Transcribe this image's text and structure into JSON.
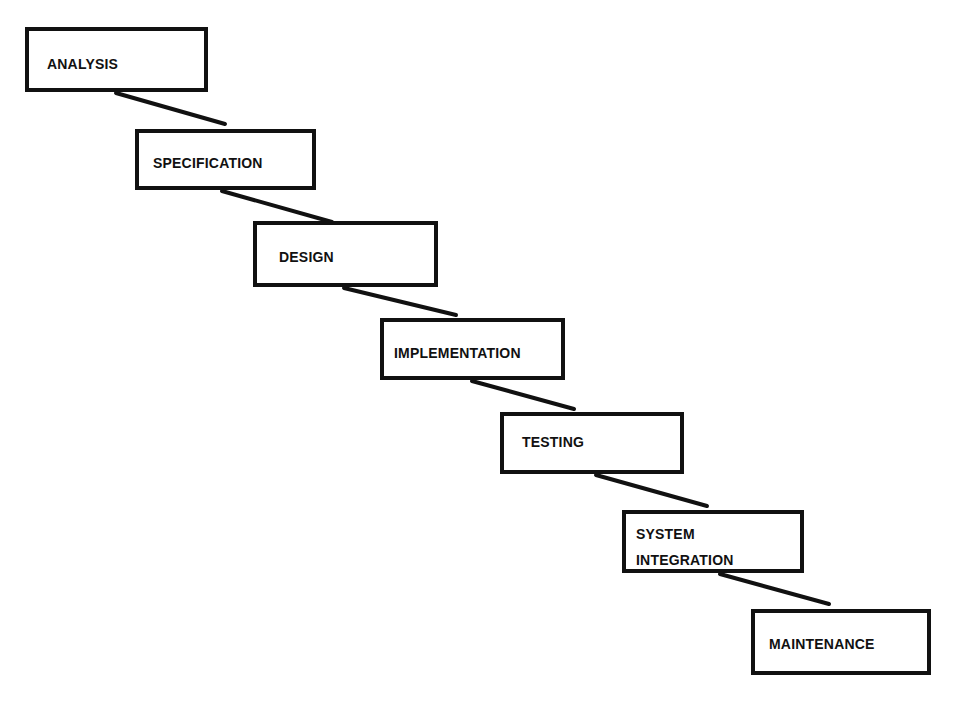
{
  "diagram": {
    "type": "waterfall-model",
    "colors": {
      "stroke": "#111111",
      "background": "#ffffff",
      "text": "#111111"
    },
    "stages": [
      {
        "label": "ANALYSIS",
        "lines": [
          "ANALYSIS"
        ],
        "box": {
          "x": 25,
          "y": 27,
          "w": 183,
          "h": 65
        },
        "text_offset": {
          "x": 18,
          "y": 20
        }
      },
      {
        "label": "SPECIFICATION",
        "lines": [
          "SPECIFICATION"
        ],
        "box": {
          "x": 135,
          "y": 129,
          "w": 181,
          "h": 61
        },
        "text_offset": {
          "x": 14,
          "y": 17
        }
      },
      {
        "label": "DESIGN",
        "lines": [
          "DESIGN"
        ],
        "box": {
          "x": 253,
          "y": 221,
          "w": 185,
          "h": 66
        },
        "text_offset": {
          "x": 22,
          "y": 19
        }
      },
      {
        "label": "IMPLEMENTATION",
        "lines": [
          "IMPLEMENTATION"
        ],
        "box": {
          "x": 380,
          "y": 318,
          "w": 185,
          "h": 62
        },
        "text_offset": {
          "x": 10,
          "y": 18
        }
      },
      {
        "label": "TESTING",
        "lines": [
          "TESTING"
        ],
        "box": {
          "x": 500,
          "y": 412,
          "w": 184,
          "h": 62
        },
        "text_offset": {
          "x": 18,
          "y": 13
        }
      },
      {
        "label": "SYSTEM INTEGRATION",
        "lines": [
          "SYSTEM",
          "INTEGRATION"
        ],
        "box": {
          "x": 622,
          "y": 510,
          "w": 182,
          "h": 63
        },
        "text_offset": {
          "x": 10,
          "y": 7
        }
      },
      {
        "label": "MAINTENANCE",
        "lines": [
          "MAINTENANCE"
        ],
        "box": {
          "x": 751,
          "y": 609,
          "w": 180,
          "h": 66
        },
        "text_offset": {
          "x": 14,
          "y": 18
        }
      }
    ],
    "connectors": [
      {
        "from": "ANALYSIS",
        "to": "SPECIFICATION",
        "x1": 116,
        "y1": 93,
        "x2": 225,
        "y2": 124
      },
      {
        "from": "SPECIFICATION",
        "to": "DESIGN",
        "x1": 222,
        "y1": 191,
        "x2": 332,
        "y2": 222
      },
      {
        "from": "DESIGN",
        "to": "IMPLEMENTATION",
        "x1": 344,
        "y1": 288,
        "x2": 456,
        "y2": 315
      },
      {
        "from": "IMPLEMENTATION",
        "to": "TESTING",
        "x1": 472,
        "y1": 381,
        "x2": 574,
        "y2": 409
      },
      {
        "from": "TESTING",
        "to": "SYSTEM INTEGRATION",
        "x1": 596,
        "y1": 475,
        "x2": 707,
        "y2": 506
      },
      {
        "from": "SYSTEM INTEGRATION",
        "to": "MAINTENANCE",
        "x1": 720,
        "y1": 574,
        "x2": 829,
        "y2": 604
      }
    ]
  }
}
